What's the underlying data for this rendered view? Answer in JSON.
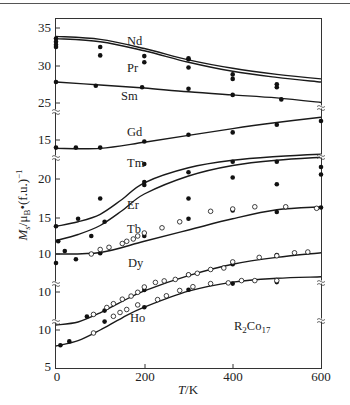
{
  "chart_data": {
    "type": "line",
    "title": "",
    "annotation": "R2Co17",
    "xlabel": "T/K",
    "ylabel": "Ms/μB·(f.u.)⁻¹",
    "xlim": [
      0,
      600
    ],
    "x_ticks": [
      0,
      200,
      400,
      600
    ],
    "y_ticks_display": [
      "35",
      "30",
      "25",
      "15",
      "20",
      "15",
      "10",
      "10",
      "10",
      "5"
    ],
    "axis_breaks": true,
    "grid": false,
    "legend": "inline labels",
    "series": [
      {
        "name": "Nd",
        "segment": "top",
        "curve": {
          "x": [
            0,
            100,
            200,
            300,
            400,
            500,
            600
          ],
          "y": [
            33.9,
            33.5,
            32.3,
            30.8,
            29.7,
            28.9,
            28.3
          ]
        },
        "points_filled": [
          [
            0,
            33.6
          ],
          [
            0,
            33.2
          ],
          [
            100,
            32.5
          ],
          [
            200,
            31.3
          ],
          [
            300,
            30.9
          ],
          [
            400,
            28.9
          ],
          [
            500,
            27.6
          ]
        ],
        "points_open": []
      },
      {
        "name": "Pr",
        "segment": "top",
        "curve": {
          "x": [
            0,
            100,
            200,
            300,
            400,
            500,
            600
          ],
          "y": [
            33.6,
            33.2,
            32.0,
            30.5,
            29.3,
            28.5,
            27.9
          ]
        },
        "points_filled": [
          [
            0,
            32.5
          ],
          [
            100,
            31.4
          ],
          [
            200,
            30.5
          ],
          [
            300,
            31.0
          ],
          [
            300,
            29.8
          ],
          [
            400,
            28.3
          ],
          [
            500,
            27.2
          ]
        ],
        "points_filled_extra": [
          [
            0,
            32.8
          ]
        ],
        "points_open": []
      },
      {
        "name": "Sm",
        "segment": "top",
        "curve": {
          "x": [
            0,
            100,
            200,
            300,
            400,
            500,
            600
          ],
          "y": [
            27.9,
            27.5,
            27.1,
            26.6,
            26.2,
            25.8,
            25.2
          ]
        },
        "points_filled": [
          [
            0,
            27.9
          ],
          [
            90,
            27.4
          ],
          [
            195,
            27.2
          ],
          [
            300,
            27.0
          ],
          [
            400,
            26.2
          ],
          [
            510,
            25.6
          ]
        ],
        "points_open": []
      },
      {
        "name": "Gd",
        "segment": "gd",
        "curve": {
          "x": [
            0,
            100,
            200,
            300,
            400,
            500,
            600
          ],
          "y": [
            13.9,
            13.9,
            14.7,
            15.6,
            16.5,
            17.3,
            18.0
          ]
        },
        "points_filled": [
          [
            0,
            14.0
          ],
          [
            45,
            14.0
          ],
          [
            100,
            14.0
          ],
          [
            200,
            14.8
          ],
          [
            300,
            15.7
          ],
          [
            400,
            16.0
          ],
          [
            500,
            17.0
          ],
          [
            600,
            17.5
          ]
        ],
        "points_open": []
      },
      {
        "name": "Tm",
        "segment": "mid",
        "curve": {
          "x": [
            0,
            50,
            100,
            150,
            200,
            300,
            400,
            500,
            600
          ],
          "y": [
            13.7,
            14.3,
            15.3,
            17.3,
            19.5,
            21.5,
            22.5,
            23.0,
            23.3
          ]
        },
        "points_filled": [
          [
            0,
            13.7
          ],
          [
            50,
            14.7
          ],
          [
            100,
            17.4
          ],
          [
            200,
            22.0
          ],
          [
            300,
            20.9
          ],
          [
            400,
            22.3
          ],
          [
            500,
            22.3
          ],
          [
            600,
            21.6
          ]
        ],
        "points_open": []
      },
      {
        "name": "Er",
        "segment": "mid",
        "curve": {
          "x": [
            0,
            50,
            100,
            150,
            200,
            300,
            400,
            500,
            600
          ],
          "y": [
            11.8,
            12.6,
            13.8,
            15.8,
            18.0,
            20.4,
            21.8,
            22.5,
            22.9
          ]
        },
        "points_filled": [
          [
            5,
            11.7
          ],
          [
            80,
            12.4
          ],
          [
            110,
            14.3
          ],
          [
            200,
            19.6
          ],
          [
            200,
            19.2
          ],
          [
            300,
            17.4
          ],
          [
            400,
            20.2
          ],
          [
            500,
            19.3
          ],
          [
            600,
            20.6
          ]
        ],
        "points_open": []
      },
      {
        "name": "Tb",
        "segment": "mid",
        "curve": {
          "x": [
            0,
            100,
            200,
            300,
            400,
            500,
            600
          ],
          "y": [
            10.0,
            10.2,
            11.7,
            13.2,
            14.7,
            15.9,
            16.3
          ]
        },
        "points_filled": [
          [
            0,
            8.8
          ],
          [
            20,
            10.4
          ],
          [
            45,
            9.3
          ],
          [
            100,
            10.1
          ],
          [
            200,
            12.4
          ],
          [
            300,
            14.7
          ],
          [
            400,
            15.8
          ],
          [
            500,
            15.6
          ],
          [
            600,
            16.2
          ]
        ],
        "points_open": [
          [
            80,
            10.0
          ],
          [
            100,
            10.6
          ],
          [
            120,
            10.9
          ],
          [
            150,
            11.4
          ],
          [
            160,
            11.7
          ],
          [
            175,
            12.0
          ],
          [
            185,
            12.4
          ],
          [
            200,
            12.8
          ],
          [
            240,
            13.5
          ],
          [
            280,
            14.3
          ],
          [
            350,
            15.7
          ],
          [
            400,
            16.0
          ],
          [
            450,
            16.3
          ],
          [
            520,
            16.3
          ],
          [
            590,
            16.1
          ]
        ]
      },
      {
        "name": "Dy",
        "segment": "dy",
        "curve": {
          "x": [
            0,
            50,
            100,
            150,
            200,
            300,
            400,
            500,
            600
          ],
          "y": [
            3.2,
            3.6,
            4.8,
            6.3,
            7.7,
            9.7,
            11.2,
            12.1,
            12.7
          ]
        },
        "points_filled": [
          [
            70,
            4.3
          ],
          [
            110,
            5.1
          ],
          [
            200,
            7.8
          ],
          [
            300,
            9.8
          ],
          [
            400,
            11.2
          ],
          [
            500,
            12.4
          ]
        ],
        "points_open": [
          [
            85,
            4.6
          ],
          [
            115,
            5.5
          ],
          [
            130,
            6.0
          ],
          [
            150,
            6.6
          ],
          [
            170,
            7.0
          ],
          [
            185,
            7.5
          ],
          [
            200,
            8.2
          ],
          [
            225,
            8.8
          ],
          [
            245,
            9.0
          ],
          [
            270,
            9.2
          ],
          [
            300,
            9.8
          ],
          [
            320,
            10.0
          ],
          [
            350,
            10.5
          ],
          [
            380,
            10.7
          ],
          [
            400,
            11.5
          ],
          [
            460,
            12.1
          ],
          [
            500,
            12.3
          ],
          [
            540,
            12.7
          ],
          [
            570,
            12.8
          ]
        ]
      },
      {
        "name": "Ho",
        "segment": "ho",
        "curve": {
          "x": [
            0,
            50,
            100,
            150,
            200,
            300,
            400,
            500,
            600
          ],
          "y": [
            7.9,
            8.6,
            10.0,
            11.6,
            13.0,
            15.1,
            16.3,
            16.8,
            17.0
          ]
        },
        "points_filled": [
          [
            10,
            8.0
          ],
          [
            30,
            8.5
          ],
          [
            110,
            11.1
          ],
          [
            200,
            13.0
          ],
          [
            300,
            15.3
          ],
          [
            400,
            16.1
          ],
          [
            500,
            16.3
          ]
        ],
        "points_open": [
          [
            85,
            9.6
          ],
          [
            130,
            11.8
          ],
          [
            145,
            12.3
          ],
          [
            160,
            12.7
          ],
          [
            185,
            13.3
          ],
          [
            230,
            14.0
          ],
          [
            250,
            14.5
          ],
          [
            280,
            15.2
          ],
          [
            310,
            15.7
          ],
          [
            350,
            16.1
          ],
          [
            390,
            16.2
          ],
          [
            420,
            16.5
          ],
          [
            450,
            16.5
          ],
          [
            500,
            16.5
          ]
        ]
      }
    ]
  },
  "labels": {
    "series": {
      "Nd": "Nd",
      "Pr": "Pr",
      "Sm": "Sm",
      "Gd": "Gd",
      "Tm": "Tm",
      "Er": "Er",
      "Tb": "Tb",
      "Dy": "Dy",
      "Ho": "Ho"
    },
    "annotation_main": "R",
    "annotation_sub1": "2",
    "annotation_mid": "Co",
    "annotation_sub2": "17",
    "xlabel_italic": "T",
    "xlabel_rest": "/K",
    "ylabel_M": "M",
    "ylabel_s": "s",
    "ylabel_mid": "/μ",
    "ylabel_B": "B",
    "ylabel_rest": "•(f.u.)",
    "ylabel_exp": "−1",
    "xticks": [
      "0",
      "200",
      "400",
      "600"
    ],
    "yticks": [
      "35",
      "30",
      "25",
      "15",
      "20",
      "15",
      "10",
      "10",
      "10",
      "5"
    ],
    "break_symbol": "≈"
  },
  "style": {
    "line_color": "#1a1a1a",
    "marker_color": "#111111",
    "frame_color": "#333333",
    "label_color": "#222222"
  }
}
